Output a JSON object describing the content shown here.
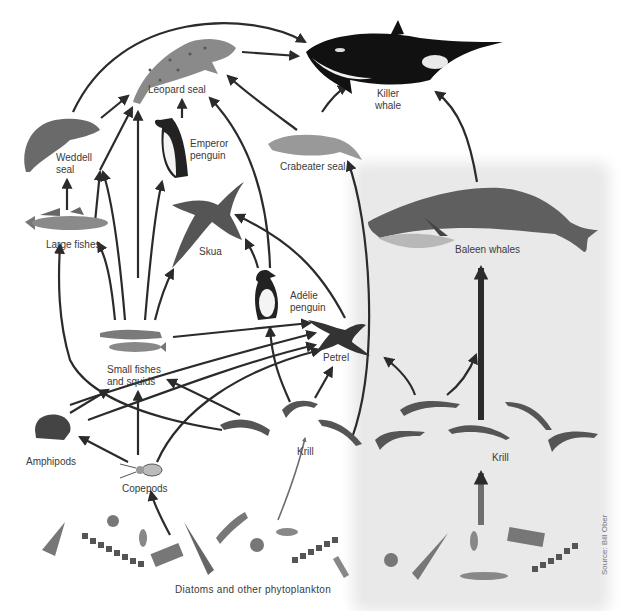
{
  "diagram": {
    "type": "food-web",
    "colors": {
      "background": "#ffffff",
      "shaded_region": "#e9e9e9",
      "arrow": "#2b2b2b",
      "baleen_arrow_bottom": "#6e6e6e",
      "label": "#3a3a3a"
    },
    "nodes": {
      "killer_whale": "Killer\nwhale",
      "killer_whale_l1": "Killer",
      "killer_whale_l2": "whale",
      "leopard_seal": "Leopard seal",
      "emperor_penguin_l1": "Emperor",
      "emperor_penguin_l2": "penguin",
      "weddell_seal_l1": "Weddell",
      "weddell_seal_l2": "seal",
      "crabeater_seal": "Crabeater seal",
      "large_fishes": "Large fishes",
      "skua": "Skua",
      "adelie_penguin_l1": "Adélie",
      "adelie_penguin_l2": "penguin",
      "baleen_whales": "Baleen whales",
      "petrel": "Petrel",
      "small_fishes_l1": "Small fishes",
      "small_fishes_l2": "and squids",
      "amphipods": "Amphipods",
      "copepods": "Copepods",
      "krill_left": "Krill",
      "krill_right": "Krill",
      "phytoplankton": "Diatoms and other phytoplankton"
    },
    "edges": [
      {
        "from": "Leopard seal",
        "to": "Killer whale"
      },
      {
        "from": "Weddell seal",
        "to": "Killer whale"
      },
      {
        "from": "Crabeater seal",
        "to": "Killer whale"
      },
      {
        "from": "Baleen whales",
        "to": "Killer whale"
      },
      {
        "from": "Weddell seal",
        "to": "Leopard seal"
      },
      {
        "from": "Emperor penguin",
        "to": "Leopard seal"
      },
      {
        "from": "Crabeater seal",
        "to": "Leopard seal"
      },
      {
        "from": "Adélie penguin",
        "to": "Leopard seal"
      },
      {
        "from": "Large fishes",
        "to": "Leopard seal"
      },
      {
        "from": "Small fishes and squids",
        "to": "Leopard seal"
      },
      {
        "from": "Large fishes",
        "to": "Weddell seal"
      },
      {
        "from": "Small fishes and squids",
        "to": "Weddell seal"
      },
      {
        "from": "Small fishes and squids",
        "to": "Large fishes"
      },
      {
        "from": "Small fishes and squids",
        "to": "Emperor penguin"
      },
      {
        "from": "Small fishes and squids",
        "to": "Skua"
      },
      {
        "from": "Adélie penguin",
        "to": "Skua"
      },
      {
        "from": "Petrel",
        "to": "Skua"
      },
      {
        "from": "Krill",
        "to": "Crabeater seal"
      },
      {
        "from": "Krill",
        "to": "Adélie penguin"
      },
      {
        "from": "Krill",
        "to": "Petrel"
      },
      {
        "from": "Small fishes and squids",
        "to": "Petrel"
      },
      {
        "from": "Amphipods",
        "to": "Petrel"
      },
      {
        "from": "Copepods",
        "to": "Petrel"
      },
      {
        "from": "Amphipods",
        "to": "Small fishes and squids"
      },
      {
        "from": "Copepods",
        "to": "Small fishes and squids"
      },
      {
        "from": "Krill",
        "to": "Small fishes and squids"
      },
      {
        "from": "Copepods",
        "to": "Amphipods"
      },
      {
        "from": "Krill",
        "to": "Large fishes"
      },
      {
        "from": "Krill",
        "to": "Baleen whales"
      },
      {
        "from": "Phytoplankton",
        "to": "Copepods"
      },
      {
        "from": "Phytoplankton",
        "to": "Krill"
      }
    ],
    "source_credit": "Source: Bill Ober"
  }
}
